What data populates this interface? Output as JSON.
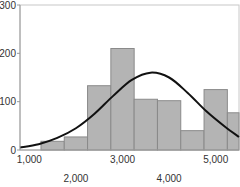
{
  "chart_data": {
    "type": "bar",
    "subtype": "histogram_with_density_curve",
    "title": "",
    "xlabel": "",
    "ylabel": "",
    "ylim": [
      0,
      300
    ],
    "xlim": [
      800,
      5500
    ],
    "grid": false,
    "legend": null,
    "y_ticks": [
      0,
      100,
      200,
      300
    ],
    "y_tick_labels": [
      "0",
      "100",
      "200",
      "300"
    ],
    "x_ticks": [
      1000,
      2000,
      3000,
      4000,
      5000
    ],
    "x_tick_labels": [
      "1,000",
      "2,000",
      "3,000",
      "4,000",
      "5,000"
    ],
    "bins": [
      {
        "start": 1250,
        "end": 1750,
        "value": 18
      },
      {
        "start": 1750,
        "end": 2250,
        "value": 27
      },
      {
        "start": 2250,
        "end": 2750,
        "value": 133
      },
      {
        "start": 2750,
        "end": 3250,
        "value": 210
      },
      {
        "start": 3250,
        "end": 3750,
        "value": 105
      },
      {
        "start": 3750,
        "end": 4250,
        "value": 102
      },
      {
        "start": 4250,
        "end": 4750,
        "value": 40
      },
      {
        "start": 4750,
        "end": 5250,
        "value": 125
      },
      {
        "start": 5250,
        "end": 5750,
        "value": 77
      }
    ],
    "curve": {
      "type": "normal_density_fit",
      "peak_x": 3600,
      "peak_y": 160,
      "points": [
        [
          800,
          5
        ],
        [
          1200,
          12
        ],
        [
          1600,
          25
        ],
        [
          2000,
          45
        ],
        [
          2400,
          75
        ],
        [
          2800,
          112
        ],
        [
          3200,
          145
        ],
        [
          3600,
          160
        ],
        [
          4000,
          150
        ],
        [
          4400,
          118
        ],
        [
          4800,
          80
        ],
        [
          5200,
          48
        ],
        [
          5500,
          27
        ]
      ]
    },
    "colors": {
      "bar_fill": "#b4b4b4",
      "bar_stroke": "#8a8a8a",
      "curve": "#111111",
      "axis": "#9a9a9a",
      "frame": "#c8c8c8"
    }
  }
}
